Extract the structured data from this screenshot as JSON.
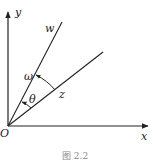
{
  "diagram": {
    "type": "vector-angle-diagram",
    "labels": {
      "y_axis": "y",
      "x_axis": "x",
      "origin": "O",
      "vector_w": "w",
      "vector_z": "z",
      "angle_omega": "ω",
      "angle_theta": "θ"
    },
    "caption": "图 2.2",
    "colors": {
      "stroke": "#222222",
      "background": "#ffffff"
    }
  }
}
